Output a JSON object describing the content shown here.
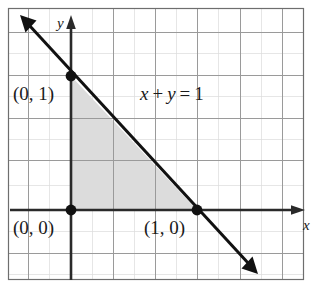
{
  "figure": {
    "kind": "cartesian-graph",
    "colors": {
      "background": "#ffffff",
      "frame": "#6e6e6e",
      "grid_major": "#9a9a9a",
      "grid_minor": "#d8d8d8",
      "axis": "#2a2a2a",
      "line": "#111111",
      "point": "#111111",
      "shaded_region": "#dcdcdc",
      "text": "#1a1a1a"
    }
  },
  "axes": {
    "x_label": "x",
    "y_label": "y",
    "origin_px": {
      "x": 71,
      "y": 210
    },
    "unit_px": {
      "x": 126,
      "y": 134
    },
    "x_range": [
      -0.5,
      1.9
    ],
    "y_range": [
      -0.47,
      1.45
    ],
    "grid": {
      "major_spacing_px": 42.5,
      "minor_spacing_px": 21.25,
      "major_vertical_px": [
        28,
        71,
        113,
        155,
        197,
        240,
        282
      ],
      "major_horizontal_px": [
        32,
        75,
        118,
        160,
        210,
        253
      ]
    }
  },
  "line": {
    "equation_label": "x + y = 1",
    "equation_terms": {
      "x": "x",
      "plus": "+",
      "y": "y",
      "equals": "=",
      "one": "1"
    },
    "slope": -1,
    "intercept": 1,
    "arrow_start_px": {
      "x": 22,
      "y": 17
    },
    "arrow_end_px": {
      "x": 256,
      "y": 272
    },
    "double_arrow": true
  },
  "points": [
    {
      "id": "y-intercept",
      "label": "(0, 1)",
      "coords": {
        "x": 0,
        "y": 1
      },
      "px": {
        "x": 71,
        "y": 76
      }
    },
    {
      "id": "origin",
      "label": "(0, 0)",
      "coords": {
        "x": 0,
        "y": 0
      },
      "px": {
        "x": 71,
        "y": 210
      }
    },
    {
      "id": "x-intercept",
      "label": "(1, 0)",
      "coords": {
        "x": 1,
        "y": 0
      },
      "px": {
        "x": 197,
        "y": 210
      }
    }
  ],
  "shaded_region": {
    "name": "feasible-triangle",
    "vertices": [
      {
        "x": 0,
        "y": 0
      },
      {
        "x": 0,
        "y": 1
      },
      {
        "x": 1,
        "y": 0
      }
    ],
    "vertices_px": [
      {
        "x": 71,
        "y": 210
      },
      {
        "x": 71,
        "y": 76
      },
      {
        "x": 197,
        "y": 210
      }
    ]
  }
}
